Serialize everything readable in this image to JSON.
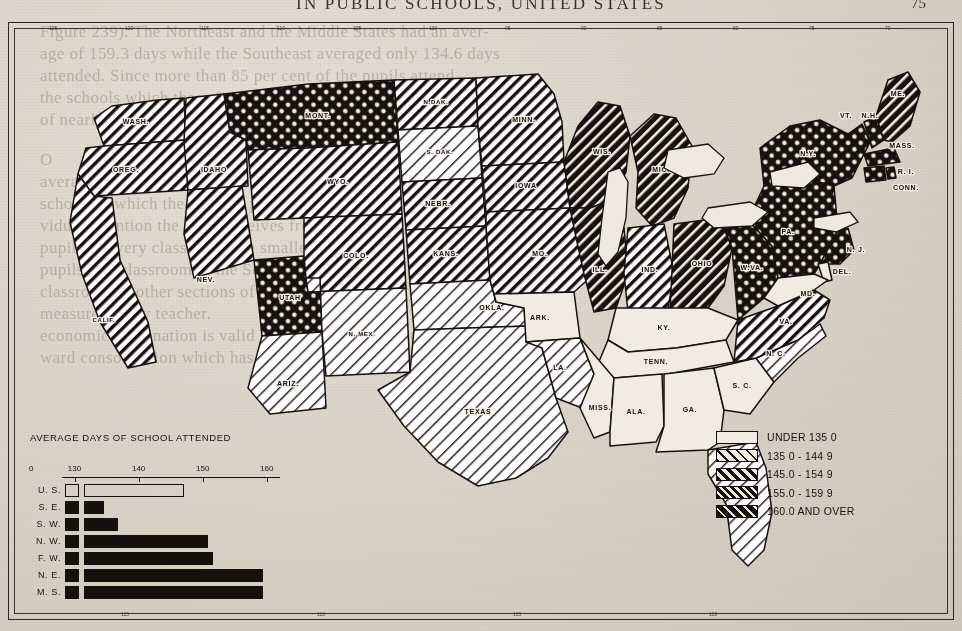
{
  "page": {
    "headline": "IN PUBLIC SCHOOLS, UNITED STATES",
    "page_number": "75"
  },
  "ghost_text": [
    {
      "t": "Figure 239).  The Northeast and the Middle States had an aver-",
      "x": 40,
      "y": 22,
      "flip": false
    },
    {
      "t": "age of 159.3 days while the Southeast averaged only 134.6 days",
      "x": 40,
      "y": 44,
      "flip": false
    },
    {
      "t": "attended.  Since more than 85 per cent of the pupils attend",
      "x": 40,
      "y": 66,
      "flip": false
    },
    {
      "t": "the schools which these figures represent, this difference",
      "x": 40,
      "y": 88,
      "flip": false
    },
    {
      "t": "of nearly 25 days between the two sections is very",
      "x": 40,
      "y": 110,
      "flip": false
    },
    {
      "t": "O",
      "x": 40,
      "y": 150,
      "flip": false
    },
    {
      "t": "average",
      "x": 40,
      "y": 172,
      "flip": false
    },
    {
      "t": "schooling which the average pupil receives and",
      "x": 40,
      "y": 194,
      "flip": false
    },
    {
      "t": "vidual attention the pupil receives from the",
      "x": 40,
      "y": 216,
      "flip": false
    },
    {
      "t": "pupils in every classroom, the smaller the instruc",
      "x": 40,
      "y": 238,
      "flip": false
    },
    {
      "t": "pupils in a classroom in the Southeast is almost",
      "x": 40,
      "y": 260,
      "flip": false
    },
    {
      "t": "classroom in other sections of the country.",
      "x": 40,
      "y": 282,
      "flip": false
    },
    {
      "t": "measures every teacher.",
      "x": 40,
      "y": 304,
      "flip": false
    },
    {
      "t": "economic explanation is valid here, but weight must be",
      "x": 40,
      "y": 326,
      "flip": false
    },
    {
      "t": "ward consolidation which has greatly reduced the number",
      "x": 40,
      "y": 348,
      "flip": false
    }
  ],
  "ruler": {
    "top_labels": [
      "125",
      "120",
      "115",
      "110",
      "105",
      "100",
      "95",
      "90",
      "85",
      "80",
      "75",
      "70"
    ],
    "bottom_labels": [
      "115",
      "110",
      "105",
      "100"
    ]
  },
  "legend": {
    "items": [
      {
        "label": "UNDER 135 0",
        "pattern": "blank"
      },
      {
        "label": "135 0 - 144 9",
        "pattern": "light-diagonal"
      },
      {
        "label": "145.0 - 154 9",
        "pattern": "medium-diagonal"
      },
      {
        "label": "155.0 - 159 9",
        "pattern": "crosshatch"
      },
      {
        "label": "160.0 AND OVER",
        "pattern": "heavy-diagonal"
      }
    ]
  },
  "chart_data": {
    "type": "bar",
    "title": "AVERAGE DAYS OF SCHOOL ATTENDED",
    "orientation": "horizontal",
    "categories": [
      "U. S.",
      "S. E.",
      "S. W.",
      "N. W.",
      "F. W.",
      "N. E.",
      "M. S."
    ],
    "values": [
      147.0,
      134.6,
      136.8,
      150.8,
      151.6,
      159.3,
      159.3
    ],
    "tick_labels": [
      "0",
      "130",
      "140",
      "150",
      "160"
    ],
    "tick_values": [
      0,
      130,
      140,
      150,
      160
    ],
    "xlim": [
      128,
      162
    ],
    "xlabel": "",
    "ylabel": "",
    "grid": false,
    "legend_position": "none",
    "note": "U. S. bar drawn hollow (outline); all regional bars solid black"
  },
  "map": {
    "states": [
      {
        "abbr": "WASH.",
        "class": "medium-diagonal"
      },
      {
        "abbr": "OREG.",
        "class": "medium-diagonal"
      },
      {
        "abbr": "IDAHO",
        "class": "medium-diagonal"
      },
      {
        "abbr": "MONT.",
        "class": "crosshatch"
      },
      {
        "abbr": "N.DAK.",
        "class": "medium-diagonal"
      },
      {
        "abbr": "S. DAK.",
        "class": "light-diagonal"
      },
      {
        "abbr": "WYO.",
        "class": "medium-diagonal"
      },
      {
        "abbr": "NEBR.",
        "class": "medium-diagonal"
      },
      {
        "abbr": "NEV.",
        "class": "medium-diagonal"
      },
      {
        "abbr": "UTAH",
        "class": "crosshatch"
      },
      {
        "abbr": "COLO.",
        "class": "medium-diagonal"
      },
      {
        "abbr": "CALIF.",
        "class": "medium-diagonal"
      },
      {
        "abbr": "ARIZ.",
        "class": "light-diagonal"
      },
      {
        "abbr": "N. MEX.",
        "class": "light-diagonal"
      },
      {
        "abbr": "KANS.",
        "class": "medium-diagonal"
      },
      {
        "abbr": "OKLA.",
        "class": "light-diagonal"
      },
      {
        "abbr": "TEXAS",
        "class": "light-diagonal"
      },
      {
        "abbr": "MINN.",
        "class": "medium-diagonal"
      },
      {
        "abbr": "IOWA",
        "class": "medium-diagonal"
      },
      {
        "abbr": "MO.",
        "class": "medium-diagonal"
      },
      {
        "abbr": "ARK.",
        "class": "blank"
      },
      {
        "abbr": "LA.",
        "class": "light-diagonal"
      },
      {
        "abbr": "WIS.",
        "class": "heavy-diagonal"
      },
      {
        "abbr": "MICH.",
        "class": "heavy-diagonal"
      },
      {
        "abbr": "ILL.",
        "class": "heavy-diagonal"
      },
      {
        "abbr": "IND.",
        "class": "medium-diagonal"
      },
      {
        "abbr": "OHIO",
        "class": "heavy-diagonal"
      },
      {
        "abbr": "KY.",
        "class": "blank"
      },
      {
        "abbr": "TENN.",
        "class": "blank"
      },
      {
        "abbr": "MISS.",
        "class": "blank"
      },
      {
        "abbr": "ALA.",
        "class": "blank"
      },
      {
        "abbr": "GA.",
        "class": "blank"
      },
      {
        "abbr": "FLA.",
        "class": "light-diagonal"
      },
      {
        "abbr": "S. C.",
        "class": "blank"
      },
      {
        "abbr": "N. C.",
        "class": "light-diagonal"
      },
      {
        "abbr": "VA.",
        "class": "medium-diagonal"
      },
      {
        "abbr": "W.VA.",
        "class": "crosshatch"
      },
      {
        "abbr": "PA.",
        "class": "crosshatch"
      },
      {
        "abbr": "N.Y.",
        "class": "crosshatch"
      },
      {
        "abbr": "VT.",
        "class": "crosshatch"
      },
      {
        "abbr": "N.H.",
        "class": "crosshatch"
      },
      {
        "abbr": "ME.",
        "class": "heavy-diagonal"
      },
      {
        "abbr": "MASS.",
        "class": "crosshatch"
      },
      {
        "abbr": "R. I.",
        "class": "crosshatch"
      },
      {
        "abbr": "CONN.",
        "class": "crosshatch"
      },
      {
        "abbr": "N. J.",
        "class": "crosshatch"
      },
      {
        "abbr": "DEL.",
        "class": "blank"
      },
      {
        "abbr": "MD.",
        "class": "blank"
      }
    ]
  }
}
